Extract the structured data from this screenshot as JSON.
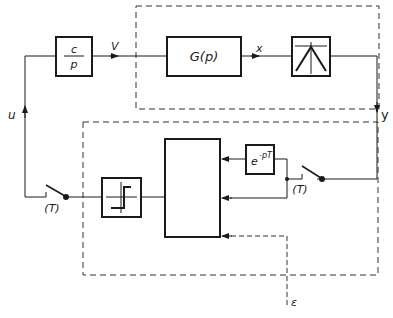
{
  "diagram": {
    "type": "block-diagram",
    "blocks": {
      "integrator": {
        "numerator": "c",
        "denominator": "p"
      },
      "plant": {
        "label": "G(p)"
      },
      "nonlinearity_peak": {
        "icon": "peak-characteristic-icon"
      },
      "delay": {
        "base": "e",
        "exponent": "-pT"
      },
      "relay": {
        "icon": "relay-characteristic-icon"
      },
      "controller": {
        "label": ""
      }
    },
    "signals": {
      "v": "V",
      "x": "x",
      "y": "y",
      "u": "u",
      "epsilon": "ε"
    },
    "switches": {
      "input_sampler": "(T)",
      "output_sampler": "(T)"
    },
    "colors": {
      "line": "#1a1a1a",
      "background": "#ffffff"
    }
  }
}
